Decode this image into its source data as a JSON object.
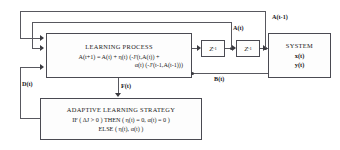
{
  "diagram": {
    "blocks": {
      "learning_process": {
        "title": "LEARNING PROCESS",
        "equation_line1": "A(t+1) = A(t) + η(t) (-J'(t,A(t)) +",
        "equation_line2": "α(t) (-J'(t-1,A(t-1)))"
      },
      "adaptive_strategy": {
        "title": "ADAPTIVE LEARNING STRATEGY",
        "rule_line1": "IF ( ΔJ > 0 ) THEN ( η(t) = 0, α(t) = 0 )",
        "rule_line2": "ELSE ( η(t), α(t) )"
      },
      "system": {
        "title": "SYSTEM",
        "output1": "x(t)",
        "output2": "y(t)"
      },
      "delay1": {
        "label": "Z",
        "exponent": "-1"
      },
      "delay2": {
        "label": "Z",
        "exponent": "-1"
      }
    },
    "signals": {
      "a_t_minus_1": "A(t-1)",
      "a_t": "A(t)",
      "b_t": "B(t)",
      "d_t": "D(t)",
      "f_t": "F(t)"
    },
    "colors": {
      "line": "#58585f",
      "border": "#4a4a52",
      "background": "#ffffff",
      "text": "#15151a"
    }
  }
}
